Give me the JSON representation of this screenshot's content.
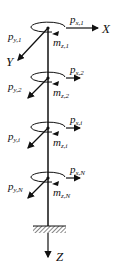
{
  "figure": {
    "axes": {
      "x": "X",
      "y": "Y",
      "z": "Z"
    },
    "nodes": [
      {
        "id": "1",
        "cy": 28,
        "px": {
          "sym": "p",
          "sub": "x,1"
        },
        "py": {
          "sym": "p",
          "sub": "y,1"
        },
        "mz": {
          "sym": "m",
          "sub": "z,1"
        }
      },
      {
        "id": "2",
        "cy": 78,
        "px": {
          "sym": "p",
          "sub": "x,2"
        },
        "py": {
          "sym": "p",
          "sub": "y,2"
        },
        "mz": {
          "sym": "m",
          "sub": "z,2"
        }
      },
      {
        "id": "i",
        "cy": 128,
        "px": {
          "sym": "p",
          "sub": "x,i"
        },
        "py": {
          "sym": "p",
          "sub": "y,i"
        },
        "mz": {
          "sym": "m",
          "sub": "z,i"
        }
      },
      {
        "id": "N",
        "cy": 178,
        "px": {
          "sym": "p",
          "sub": "x,N"
        },
        "py": {
          "sym": "p",
          "sub": "y,N"
        },
        "mz": {
          "sym": "m",
          "sub": "z,N"
        }
      }
    ],
    "support": "fixed-base-hatch"
  }
}
